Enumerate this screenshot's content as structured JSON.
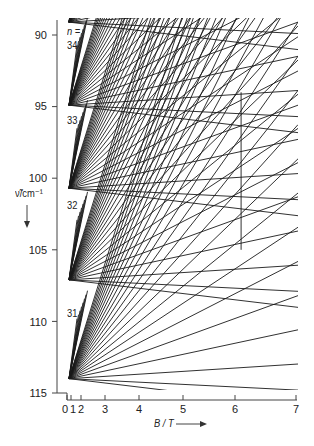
{
  "chart_data": {
    "type": "line",
    "title": "",
    "xlabel": "B / T",
    "ylabel": "ν̃ / cm⁻¹",
    "x_ticks": [
      "0",
      "1",
      "2",
      "3",
      "4",
      "5",
      "6",
      "7"
    ],
    "y_ticks": [
      "90",
      "95",
      "100",
      "105",
      "110",
      "115"
    ],
    "xlim": [
      0,
      7
    ],
    "ylim": [
      115,
      90
    ],
    "y_inverted": true,
    "x_scale": "quadratic-like (B² spacing)",
    "grid": false,
    "legend": null,
    "annotations": [
      "n =",
      "34",
      "33",
      "32",
      "31"
    ],
    "fans": [
      {
        "n": 34,
        "apex_y": 89.1,
        "label_y": 91.5
      },
      {
        "n": 33,
        "apex_y": 94.9,
        "label_y": 96.0
      },
      {
        "n": 32,
        "apex_y": 100.7,
        "label_y": 101.9
      },
      {
        "n": 31,
        "apex_y": 107.1,
        "label_y": 109.4
      },
      {
        "n": 30,
        "apex_y": 114.0,
        "label_y": null
      }
    ],
    "series_description": "Landau/Zeeman-like fans of straight lines radiating from each level n toward higher B, crossing each other; a vertical line near B ≈ 6.1 T from ν̃ ≈ 94 to 105"
  },
  "axes": {
    "x_label_text": "B / T",
    "y_label_text": "ν̃/cm⁻¹",
    "n_prefix": "n ="
  },
  "colors": {
    "ink": "#1a1a1a",
    "background": "#ffffff"
  }
}
